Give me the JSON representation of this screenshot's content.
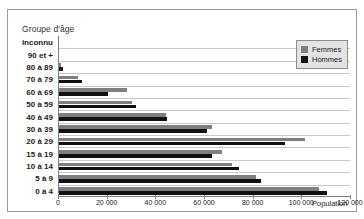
{
  "chart_data": {
    "type": "bar",
    "orientation": "horizontal",
    "title": "",
    "ylabel": "Groupe d'âge",
    "xlabel": "Population",
    "xlim": [
      0,
      120000
    ],
    "xticks": [
      0,
      20000,
      40000,
      60000,
      80000,
      100000,
      120000
    ],
    "xticklabels": [
      "0",
      "20 000",
      "40 000",
      "60 000",
      "80 000",
      "100 000",
      "120 000"
    ],
    "grid": true,
    "legend_position": "top-right",
    "categories": [
      "inconnu",
      "90 et +",
      "80 à 89",
      "70 à 79",
      "60 à 69",
      "50 à 59",
      "40 à 49",
      "30 à 39",
      "20 à 29",
      "15 à 19",
      "10 à 14",
      "5 à 9",
      "0 à 4"
    ],
    "series": [
      {
        "name": "Femmes",
        "color": "#7f7f7f",
        "values": [
          0,
          0,
          1000,
          8000,
          28000,
          30000,
          44000,
          63000,
          101000,
          67000,
          71000,
          81000,
          107000
        ]
      },
      {
        "name": "Hommes",
        "color": "#111111",
        "values": [
          0,
          0,
          1800,
          9500,
          20000,
          31500,
          44500,
          61000,
          93000,
          63000,
          74000,
          83000,
          110000
        ]
      }
    ]
  },
  "legend": {
    "items": [
      {
        "label": "Femmes",
        "color": "#7f7f7f"
      },
      {
        "label": "Hommes",
        "color": "#111111"
      }
    ]
  }
}
